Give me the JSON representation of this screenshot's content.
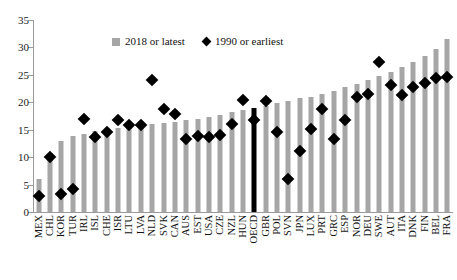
{
  "chart_data": {
    "type": "bar",
    "title": "",
    "xlabel": "",
    "ylabel": "",
    "ylim": [
      0,
      35
    ],
    "yticks": [
      0,
      5,
      10,
      15,
      20,
      25,
      30,
      35
    ],
    "grid": false,
    "legend_position": "top-center",
    "categories": [
      "MEX",
      "CHL",
      "KOR",
      "TUR",
      "IRL",
      "ISL",
      "CHE",
      "ISR",
      "LTU",
      "LVA",
      "NLD",
      "SVK",
      "CAN",
      "AUS",
      "EST",
      "USA",
      "CZE",
      "NZL",
      "HUN",
      "OECD",
      "GBR",
      "POL",
      "SVN",
      "JPN",
      "LUX",
      "PRT",
      "GRC",
      "ESP",
      "NOR",
      "DEU",
      "SWE",
      "AUT",
      "ITA",
      "DNK",
      "FIN",
      "BEL",
      "FRA"
    ],
    "highlight_category": "OECD",
    "highlight_color": "#000000",
    "bar_color": "#a6a6a6",
    "marker_color": "#000000",
    "series": [
      {
        "name": "2018 or latest",
        "marker": "bar",
        "values": [
          6.0,
          10.3,
          12.9,
          13.9,
          14.3,
          14.8,
          15.1,
          15.4,
          15.6,
          15.8,
          16.0,
          16.2,
          16.4,
          16.7,
          17.0,
          17.3,
          17.6,
          18.2,
          18.6,
          19.0,
          19.4,
          19.8,
          20.2,
          20.7,
          21.0,
          21.5,
          22.0,
          22.7,
          23.4,
          24.1,
          24.8,
          25.6,
          26.4,
          27.3,
          28.4,
          29.8,
          31.5
        ]
      },
      {
        "name": "1990 or earliest",
        "marker": "diamond",
        "values": [
          3.0,
          10.0,
          3.2,
          4.2,
          17.0,
          13.6,
          14.6,
          16.8,
          15.9,
          15.8,
          24.0,
          18.7,
          17.9,
          13.3,
          13.9,
          13.6,
          14.1,
          16.0,
          20.5,
          16.7,
          20.3,
          14.6,
          6.0,
          11.1,
          15.2,
          18.8,
          13.4,
          16.8,
          21.0,
          21.5,
          27.4,
          23.2,
          21.4,
          22.8,
          23.5,
          24.4,
          24.6
        ]
      }
    ]
  },
  "legend": {
    "entries": [
      {
        "label": "2018 or latest",
        "marker": "square",
        "color": "#a6a6a6"
      },
      {
        "label": "1990 or earliest",
        "marker": "diamond",
        "color": "#000000"
      }
    ]
  }
}
